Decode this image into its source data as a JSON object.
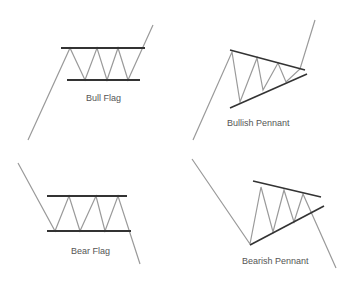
{
  "patterns": [
    {
      "name": "bull-flag",
      "label": "Bull Flag"
    },
    {
      "name": "bullish-pennant",
      "label": "Bullish Pennant"
    },
    {
      "name": "bear-flag",
      "label": "Bear Flag"
    },
    {
      "name": "bearish-pennant",
      "label": "Bearish Pennant"
    }
  ],
  "colors": {
    "trend_line": "#9a9a9a",
    "boundary_line": "#333333",
    "label": "#555555"
  }
}
